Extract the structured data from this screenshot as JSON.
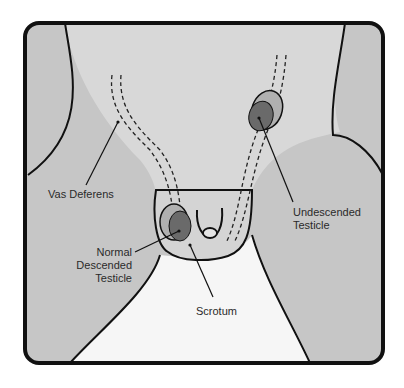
{
  "diagram": {
    "type": "anatomical-illustration",
    "labels": {
      "vas_deferens": "Vas Deferens",
      "undescended_line1": "Undescended",
      "undescended_line2": "Testicle",
      "normal_line1": "Normal",
      "normal_line2": "Descended",
      "normal_line3": "Testicle",
      "scrotum": "Scrotum"
    },
    "colors": {
      "background": "#ffffff",
      "skin_dark": "#c9c9c9",
      "skin_light": "#dcdcdc",
      "testicle": "#6e6e6e",
      "testicle_sac": "#b4b4b4",
      "outline": "#111111"
    }
  }
}
